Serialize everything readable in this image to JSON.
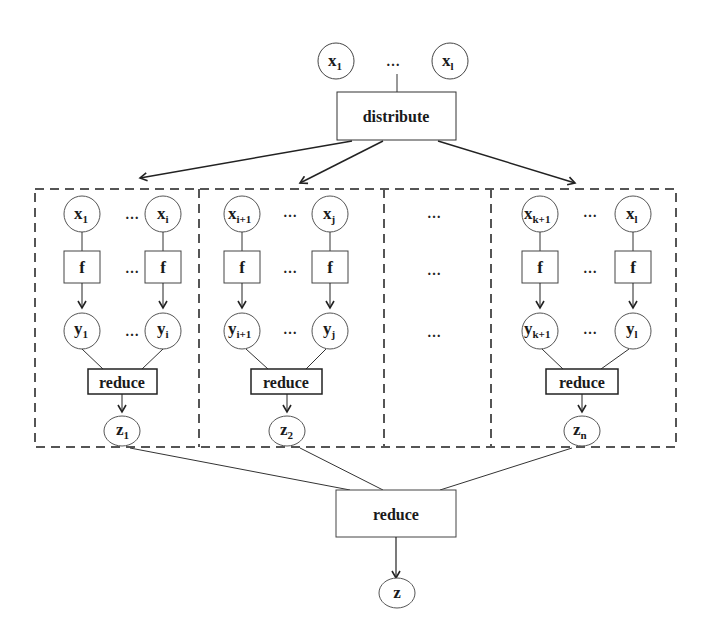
{
  "diagram": {
    "type": "map-reduce flow",
    "colors": {
      "stroke": "#333333",
      "dash": "#555555",
      "text": "#1a1a1a",
      "background": "#ffffff"
    },
    "inputs": [
      {
        "base": "x",
        "sub": "1"
      },
      {
        "base": "x",
        "sub": "l"
      }
    ],
    "input_ellipsis": "…",
    "distribute_label": "distribute",
    "partitions": [
      {
        "x_nodes": [
          {
            "base": "x",
            "sub": "1"
          },
          {
            "base": "x",
            "sub": "i"
          }
        ],
        "f_labels": [
          "f",
          "f"
        ],
        "y_nodes": [
          {
            "base": "y",
            "sub": "1"
          },
          {
            "base": "y",
            "sub": "i"
          }
        ],
        "reduce_label": "reduce",
        "z_node": {
          "base": "z",
          "sub": "1"
        },
        "ellipsis": "…"
      },
      {
        "x_nodes": [
          {
            "base": "x",
            "sub": "i+1"
          },
          {
            "base": "x",
            "sub": "j"
          }
        ],
        "f_labels": [
          "f",
          "f"
        ],
        "y_nodes": [
          {
            "base": "y",
            "sub": "i+1"
          },
          {
            "base": "y",
            "sub": "j"
          }
        ],
        "reduce_label": "reduce",
        "z_node": {
          "base": "z",
          "sub": "2"
        },
        "ellipsis": "…"
      },
      {
        "x_nodes": [
          {
            "base": "x",
            "sub": "k+1"
          },
          {
            "base": "x",
            "sub": "l"
          }
        ],
        "f_labels": [
          "f",
          "f"
        ],
        "y_nodes": [
          {
            "base": "y",
            "sub": "k+1"
          },
          {
            "base": "y",
            "sub": "l"
          }
        ],
        "reduce_label": "reduce",
        "z_node": {
          "base": "z",
          "sub": "n"
        },
        "ellipsis": "…"
      }
    ],
    "middle_ellipsis": [
      "…",
      "…",
      "…"
    ],
    "final_reduce_label": "reduce",
    "output": {
      "base": "z",
      "sub": ""
    }
  }
}
